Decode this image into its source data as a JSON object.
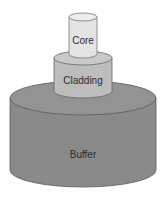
{
  "diagram": {
    "type": "layered-cylinder",
    "layers": [
      {
        "id": "core",
        "label": "Core",
        "color": "#e4e4e4"
      },
      {
        "id": "cladding",
        "label": "Cladding",
        "color": "#bdbdbd"
      },
      {
        "id": "buffer",
        "label": "Buffer",
        "color": "#8a8a8a"
      }
    ],
    "outline_color": "#555555"
  }
}
